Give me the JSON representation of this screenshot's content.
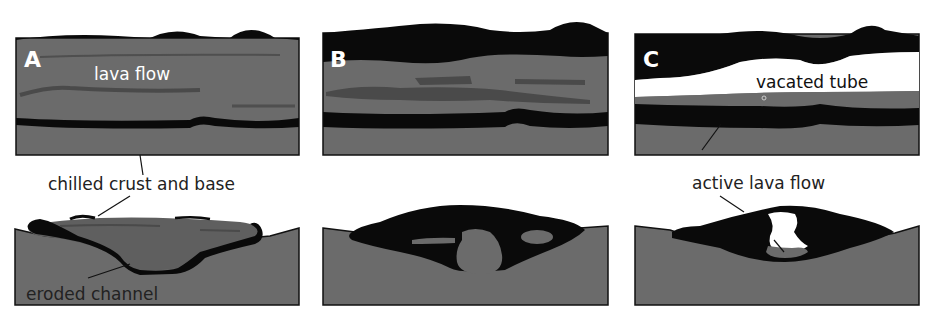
{
  "figure": {
    "colors": {
      "ground": "#6b6b6b",
      "lava": "#5f5f5f",
      "lava_dark": "#4a4a4a",
      "crust": "#0a0a0a",
      "void": "#ffffff",
      "text_light": "#ffffff",
      "text_dark": "#222222"
    },
    "panels": [
      {
        "letter": "A",
        "inline_label": "lava flow"
      },
      {
        "letter": "B"
      },
      {
        "letter": "C",
        "inline_label": "vacated tube"
      }
    ],
    "callouts": {
      "chilled": "chilled crust and base",
      "eroded": "eroded channel",
      "active": "active lava flow"
    }
  }
}
